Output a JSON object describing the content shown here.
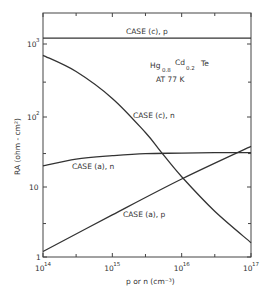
{
  "chart_data": {
    "type": "line",
    "title": "",
    "xlabel": "p or n (cm⁻³)",
    "ylabel": "RA (ohm - cm²)",
    "xscale": "log",
    "yscale": "log",
    "xlim": [
      100000000000000.0,
      1e+17
    ],
    "ylim": [
      1,
      2700
    ],
    "grid": false,
    "x_ticks": [
      {
        "value": 100000000000000.0,
        "label": "10",
        "exp": "14"
      },
      {
        "value": 1000000000000000.0,
        "label": "10",
        "exp": "15"
      },
      {
        "value": 1e+16,
        "label": "10",
        "exp": "16"
      },
      {
        "value": 1e+17,
        "label": "10",
        "exp": "17"
      }
    ],
    "y_ticks": [
      {
        "value": 1,
        "label": "1",
        "exp": ""
      },
      {
        "value": 10,
        "label": "10",
        "exp": ""
      },
      {
        "value": 100,
        "label": "10",
        "exp": "2"
      },
      {
        "value": 1000,
        "label": "10",
        "exp": "3"
      }
    ],
    "annotation": {
      "material": "Hg",
      "hg_sub": "0.8",
      "cd": "Cd",
      "cd_sub": "0.2",
      "te": "Te",
      "temperature": "AT 77 K"
    },
    "series": [
      {
        "name": "CASE (c), p",
        "x": [
          100000000000000.0,
          1000000000000000.0,
          1e+16,
          1e+17
        ],
        "y": [
          1200,
          1200,
          1200,
          1200
        ]
      },
      {
        "name": "CASE (c), n",
        "x": [
          100000000000000.0,
          300000000000000.0,
          1000000000000000.0,
          3000000000000000.0,
          5000000000000000.0,
          1e+16,
          3e+16,
          1e+17
        ],
        "y": [
          700,
          420,
          180,
          60,
          32,
          14,
          4.5,
          1.6
        ]
      },
      {
        "name": "CASE (a), n",
        "x": [
          100000000000000.0,
          300000000000000.0,
          1000000000000000.0,
          3000000000000000.0,
          1e+16,
          3e+16,
          1e+17
        ],
        "y": [
          20,
          25,
          28,
          30,
          30.5,
          31,
          31
        ]
      },
      {
        "name": "CASE (a), p",
        "x": [
          100000000000000.0,
          1000000000000000.0,
          1e+16,
          1e+17
        ],
        "y": [
          1.2,
          4,
          13,
          38
        ]
      }
    ],
    "series_labels": [
      {
        "text": "CASE (c), p",
        "x_px": 126,
        "y_px": 34
      },
      {
        "text": "CASE (c), n",
        "x_px": 133,
        "y_px": 118
      },
      {
        "text": "CASE (a), n",
        "x_px": 72,
        "y_px": 169
      },
      {
        "text": "CASE (a), p",
        "x_px": 123,
        "y_px": 217
      }
    ]
  }
}
